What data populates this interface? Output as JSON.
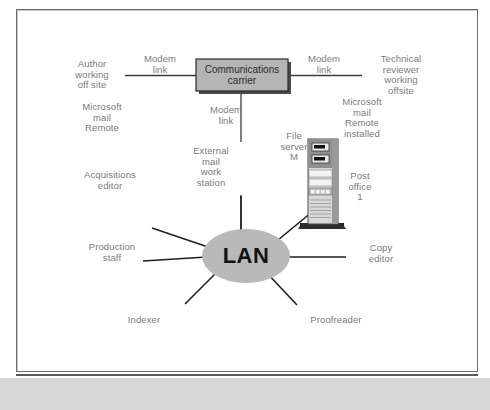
{
  "diagram": {
    "colors": {
      "node_fill": "#b9b9b9",
      "box_fill": "#b5b5b5",
      "line": "#3c3c3c",
      "label_text": "#7a7a7a",
      "frame": "#6b6b6b",
      "band": "#d7d7d7"
    },
    "central_node": {
      "name": "lan-node",
      "label": "LAN",
      "shape": "ellipse"
    },
    "carrier_box": {
      "name": "communications-carrier-box",
      "label": "Communications\ncarrier",
      "shape": "rectangle"
    },
    "links": [
      {
        "name": "modem-link-left",
        "label": "Modem\nlink"
      },
      {
        "name": "modem-link-right",
        "label": "Modem\nlink"
      },
      {
        "name": "modem-link-down",
        "label": "Modem\nlink"
      }
    ],
    "labels": [
      {
        "name": "author-working-off-site-label",
        "text": "Author\nworking\noff site"
      },
      {
        "name": "microsoft-mail-remote-left-label",
        "text": "Microsoft\nmail\nRemote"
      },
      {
        "name": "acquisitions-editor-label",
        "text": "Acquisitions\neditor"
      },
      {
        "name": "external-mail-work-station-label",
        "text": "External\nmail\nwork\nstation"
      },
      {
        "name": "technical-reviewer-label",
        "text": "Technical\nreviewer\nworking\noffsite"
      },
      {
        "name": "microsoft-mail-remote-installed-label",
        "text": "Microsoft\nmail\nRemote\ninstalled"
      },
      {
        "name": "file-server-m-label",
        "text": "File\nserver\nM"
      },
      {
        "name": "post-office-1-label",
        "text": "Post\noffice\n1"
      },
      {
        "name": "production-staff-label",
        "text": "Production\nstaff"
      },
      {
        "name": "indexer-label",
        "text": "Indexer"
      },
      {
        "name": "copy-editor-label",
        "text": "Copy\neditor"
      },
      {
        "name": "proofreader-label",
        "text": "Proofreader"
      }
    ],
    "devices": [
      {
        "name": "file-server-tower",
        "type": "tower-server"
      },
      {
        "name": "workstation-monitor",
        "type": "desktop-monitor"
      }
    ]
  }
}
